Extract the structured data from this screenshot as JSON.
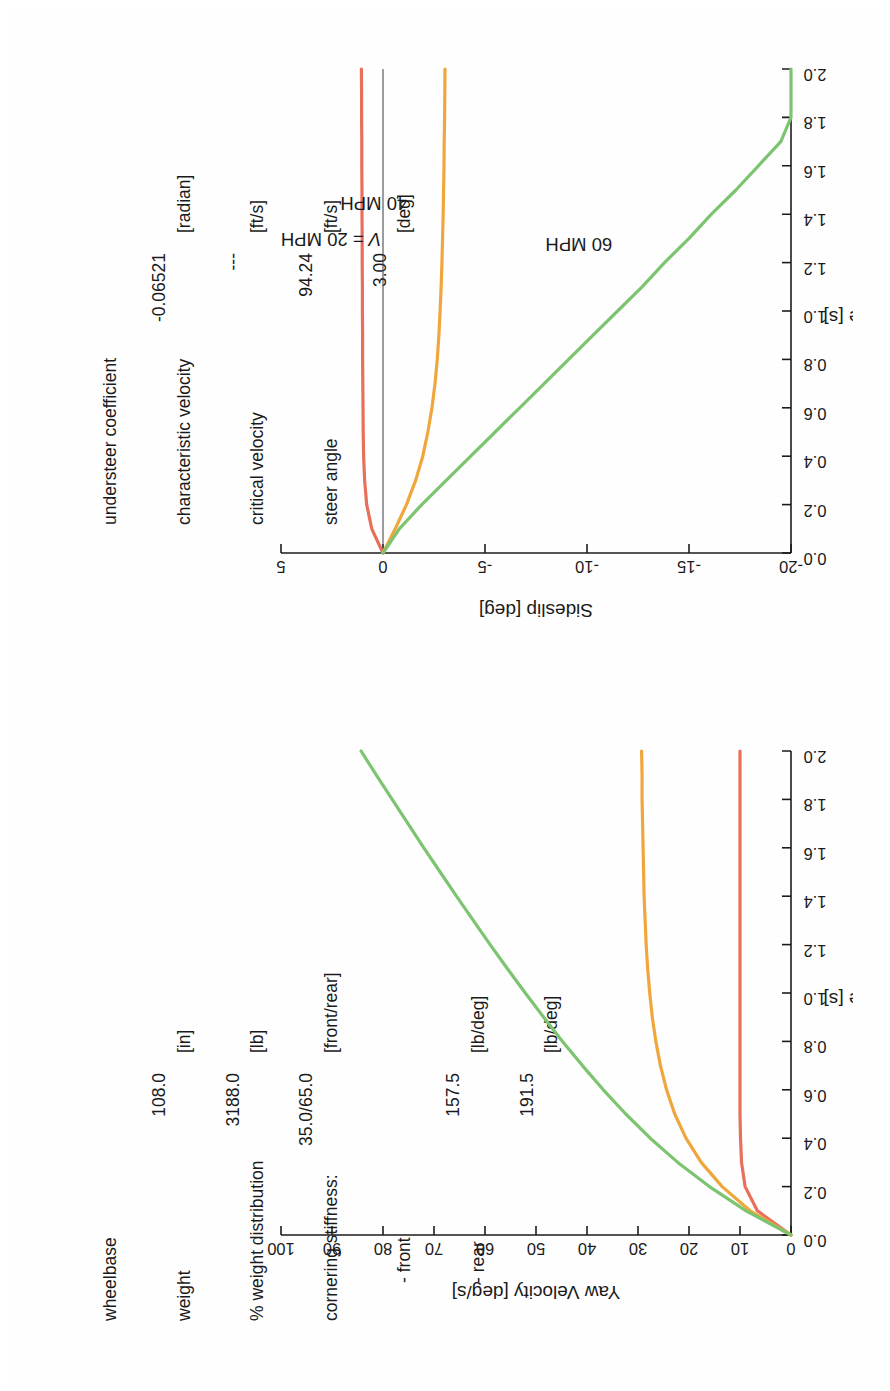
{
  "document": {
    "kind": "scanned-figure-page",
    "orientation": "landscape-rotated-90ccw",
    "border_color": "#1c1a1a",
    "page_background": "#ffffff"
  },
  "vehicle_parameters": {
    "rows": [
      {
        "label": "wheelbase",
        "value": "108.0",
        "unit": "[in]"
      },
      {
        "label": "weight",
        "value": "3188.0",
        "unit": "[lb]"
      },
      {
        "label": "% weight distribution",
        "value": "35.0/65.0",
        "unit": "[front/rear]"
      },
      {
        "label": "cornering stiffness:",
        "value": "",
        "unit": ""
      },
      {
        "label": "- front",
        "value": "157.5",
        "unit": "[lb/deg]",
        "indent": true
      },
      {
        "label": "- rear",
        "value": "191.5",
        "unit": "[lb/deg]",
        "indent": true
      }
    ]
  },
  "result_parameters": {
    "rows": [
      {
        "label": "understeer coefficient",
        "value": "-0.06521",
        "unit": "[radian]"
      },
      {
        "label": "characteristic velocity",
        "value": "---",
        "unit": "[ft/s]"
      },
      {
        "label": "critical velocity",
        "value": "94.24",
        "unit": "[ft/s]"
      },
      {
        "label": "steer angle",
        "value": "3.00",
        "unit": "[deg]"
      }
    ]
  },
  "colors": {
    "v20": "#e8705a",
    "v40": "#f0a63c",
    "v60": "#7cc470",
    "axis": "#1d1b1b",
    "zero_line": "#4a4a52"
  },
  "chart_data": [
    {
      "type": "line",
      "id": "yaw-velocity-plot",
      "title": "",
      "xlabel": "Time [s]",
      "ylabel": "Yaw Velocity [deg/s]",
      "xlim": [
        0.0,
        2.0
      ],
      "ylim": [
        0,
        100
      ],
      "xticks": [
        "0.0",
        "0.2",
        "0.4",
        "0.6",
        "0.8",
        "1.0",
        "1.2",
        "1.4",
        "1.6",
        "1.8",
        "2.0"
      ],
      "yticks": [
        "0",
        "10",
        "20",
        "30",
        "40",
        "50",
        "60",
        "70",
        "80",
        "90",
        "100"
      ],
      "grid": false,
      "legend": "none",
      "x": [
        0.0,
        0.1,
        0.2,
        0.3,
        0.4,
        0.5,
        0.6,
        0.7,
        0.8,
        0.9,
        1.0,
        1.1,
        1.2,
        1.3,
        1.4,
        1.5,
        1.6,
        1.7,
        1.8,
        1.9,
        2.0
      ],
      "series": [
        {
          "name": "V = 20 MPH",
          "color": "#e8705a",
          "values": [
            0.0,
            6.6,
            9.0,
            9.7,
            9.9,
            10.0,
            10.0,
            10.0,
            10.0,
            10.0,
            10.0,
            10.0,
            10.0,
            10.0,
            10.0,
            10.0,
            10.0,
            10.0,
            10.0,
            10.0,
            10.0
          ]
        },
        {
          "name": "40 MPH",
          "color": "#f0a63c",
          "values": [
            0.0,
            8.0,
            13.5,
            17.6,
            20.6,
            22.8,
            24.4,
            25.6,
            26.5,
            27.2,
            27.7,
            28.1,
            28.4,
            28.6,
            28.8,
            28.9,
            29.0,
            29.1,
            29.2,
            29.2,
            29.3
          ]
        },
        {
          "name": "60 MPH",
          "color": "#7cc470",
          "values": [
            0.0,
            8.8,
            16.0,
            22.2,
            27.6,
            32.4,
            36.8,
            40.9,
            44.8,
            48.5,
            52.1,
            55.6,
            59.0,
            62.3,
            65.6,
            68.8,
            72.0,
            75.1,
            78.2,
            81.3,
            84.3
          ]
        }
      ]
    },
    {
      "type": "line",
      "id": "sideslip-plot",
      "title": "",
      "xlabel": "Time [s]",
      "ylabel": "Sideslip [deg]",
      "xlim": [
        0.0,
        2.0
      ],
      "ylim": [
        -20,
        5
      ],
      "xticks": [
        "0.0",
        "0.2",
        "0.4",
        "0.6",
        "0.8",
        "1.0",
        "1.2",
        "1.4",
        "1.6",
        "1.8",
        "2.0"
      ],
      "yticks": [
        "5",
        "0",
        "-5",
        "-10",
        "-15",
        "-20"
      ],
      "grid": false,
      "legend": "none",
      "x": [
        0.0,
        0.1,
        0.2,
        0.3,
        0.4,
        0.5,
        0.6,
        0.7,
        0.8,
        0.9,
        1.0,
        1.1,
        1.2,
        1.3,
        1.4,
        1.5,
        1.6,
        1.7,
        1.8,
        1.9,
        2.0
      ],
      "series": [
        {
          "name": "V = 20 MPH",
          "color": "#e8705a",
          "values": [
            0.0,
            0.55,
            0.8,
            0.9,
            0.95,
            0.97,
            0.98,
            0.99,
            1.0,
            1.0,
            1.01,
            1.01,
            1.02,
            1.02,
            1.03,
            1.03,
            1.04,
            1.04,
            1.05,
            1.05,
            1.06
          ]
        },
        {
          "name": "40 MPH",
          "color": "#f0a63c",
          "values": [
            0.0,
            -0.6,
            -1.15,
            -1.6,
            -1.95,
            -2.2,
            -2.4,
            -2.55,
            -2.66,
            -2.74,
            -2.8,
            -2.85,
            -2.89,
            -2.92,
            -2.95,
            -2.97,
            -2.99,
            -3.0,
            -3.02,
            -3.03,
            -3.04
          ]
        },
        {
          "name": "60 MPH",
          "color": "#7cc470",
          "values": [
            0.0,
            -0.8,
            -1.9,
            -3.1,
            -4.3,
            -5.5,
            -6.7,
            -7.9,
            -9.1,
            -10.3,
            -11.5,
            -12.7,
            -13.8,
            -15.0,
            -16.1,
            -17.3,
            -18.4,
            -19.5,
            -20.0,
            -20.0,
            -20.0
          ]
        }
      ],
      "annotations": [
        {
          "text": "V = 20 MPH",
          "series": "V = 20 MPH",
          "italic_prefix": "V"
        },
        {
          "text": "40 MPH",
          "series": "40 MPH"
        },
        {
          "text": "60 MPH",
          "series": "60 MPH"
        }
      ]
    }
  ],
  "labels": {
    "time_axis": "Time [s]",
    "sideslip_axis": "Sideslip [deg]",
    "yaw_axis": "Yaw Velocity [deg/s]",
    "ann_v20": "V = 20 MPH",
    "ann_v20_italic": "V",
    "ann_v20_rest": " = 20 MPH",
    "ann_v40": "40 MPH",
    "ann_v60": "60 MPH"
  }
}
